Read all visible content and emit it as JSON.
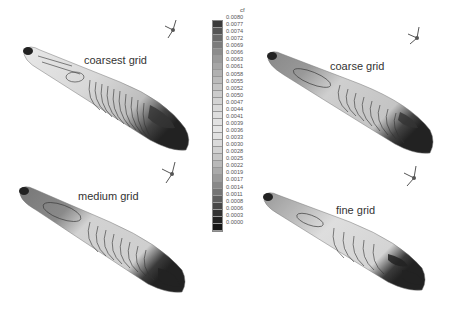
{
  "panels": [
    {
      "id": "coarsest",
      "label": "coarsest grid"
    },
    {
      "id": "coarse",
      "label": "coarse grid"
    },
    {
      "id": "medium",
      "label": "medium grid"
    },
    {
      "id": "fine",
      "label": "fine grid"
    }
  ],
  "colorbar": {
    "variable": "cf",
    "levels": [
      "0.0080",
      "0.0077",
      "0.0074",
      "0.0072",
      "0.0069",
      "0.0066",
      "0.0063",
      "0.0061",
      "0.0058",
      "0.0055",
      "0.0052",
      "0.0050",
      "0.0047",
      "0.0044",
      "0.0041",
      "0.0039",
      "0.0036",
      "0.0033",
      "0.0030",
      "0.0028",
      "0.0025",
      "0.0022",
      "0.0019",
      "0.0017",
      "0.0014",
      "0.0011",
      "0.0008",
      "0.0006",
      "0.0003",
      "0.0000"
    ],
    "colors": [
      "#3a3a3a",
      "#555555",
      "#6a6a6a",
      "#7c7c7c",
      "#8c8c8c",
      "#9a9a9a",
      "#a6a6a6",
      "#b1b1b1",
      "#bbbbbb",
      "#c4c4c4",
      "#cccccc",
      "#d3d3d3",
      "#d9d9d9",
      "#dedede",
      "#e2e2e2",
      "#e5e5e5",
      "#e1e1e1",
      "#dadada",
      "#d1d1d1",
      "#c6c6c6",
      "#b9b9b9",
      "#aaaaaa",
      "#9a9a9a",
      "#888888",
      "#747474",
      "#5e5e5e",
      "#474747",
      "#333333",
      "#222222",
      "#151515"
    ]
  }
}
